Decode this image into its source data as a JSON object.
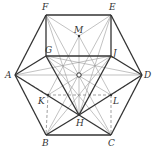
{
  "diagram": {
    "type": "geometry",
    "colors": {
      "bold": "#333333",
      "thin": "#999999",
      "dashed": "#777777",
      "point": "#333333"
    },
    "points": [
      {
        "id": "F",
        "label": "F",
        "x": 46,
        "y": 15,
        "lx": 42,
        "ly": 10
      },
      {
        "id": "E",
        "label": "E",
        "x": 111,
        "y": 15,
        "lx": 109,
        "ly": 10
      },
      {
        "id": "A",
        "label": "A",
        "x": 15,
        "y": 75,
        "lx": 5,
        "ly": 78
      },
      {
        "id": "D",
        "label": "D",
        "x": 142,
        "y": 75,
        "lx": 144,
        "ly": 78
      },
      {
        "id": "B",
        "label": "B",
        "x": 46,
        "y": 135,
        "lx": 42,
        "ly": 146
      },
      {
        "id": "C",
        "label": "C",
        "x": 111,
        "y": 135,
        "lx": 108,
        "ly": 146
      },
      {
        "id": "G",
        "label": "G",
        "x": 46,
        "y": 56,
        "lx": 45,
        "ly": 53
      },
      {
        "id": "J",
        "label": "J",
        "x": 111,
        "y": 56,
        "lx": 113,
        "ly": 56
      },
      {
        "id": "M",
        "label": "M",
        "x": 79,
        "y": 36,
        "lx": 74,
        "ly": 33
      },
      {
        "id": "K",
        "label": "K",
        "x": 48,
        "y": 95,
        "lx": 38,
        "ly": 104
      },
      {
        "id": "L",
        "label": "L",
        "x": 111,
        "y": 95,
        "lx": 113,
        "ly": 104
      },
      {
        "id": "H",
        "label": "H",
        "x": 79,
        "y": 115,
        "lx": 76,
        "ly": 126
      },
      {
        "id": "O",
        "label": "",
        "x": 79,
        "y": 75,
        "lx": 0,
        "ly": 0
      }
    ],
    "bold_segments": [
      [
        "A",
        "B"
      ],
      [
        "B",
        "C"
      ],
      [
        "C",
        "D"
      ],
      [
        "D",
        "E"
      ],
      [
        "E",
        "F"
      ],
      [
        "F",
        "A"
      ],
      [
        "F",
        "G"
      ],
      [
        "E",
        "J"
      ],
      [
        "G",
        "J"
      ],
      [
        "A",
        "G"
      ],
      [
        "A",
        "H"
      ],
      [
        "G",
        "H"
      ],
      [
        "J",
        "H"
      ],
      [
        "J",
        "D"
      ],
      [
        "H",
        "C"
      ],
      [
        "B",
        "H"
      ],
      [
        "D",
        "H"
      ]
    ],
    "thin_segments": [
      [
        "A",
        "D"
      ],
      [
        "F",
        "C"
      ],
      [
        "E",
        "B"
      ],
      [
        "M",
        "H"
      ],
      [
        "F",
        "M"
      ],
      [
        "E",
        "M"
      ],
      [
        "G",
        "L"
      ],
      [
        "J",
        "K"
      ],
      [
        "A",
        "J"
      ],
      [
        "D",
        "G"
      ],
      [
        "M",
        "K"
      ],
      [
        "M",
        "L"
      ],
      [
        "F",
        "H"
      ],
      [
        "E",
        "H"
      ],
      [
        "G",
        "C"
      ],
      [
        "J",
        "B"
      ]
    ],
    "dashed_segments": [
      [
        "K",
        "L"
      ],
      [
        "K",
        "B"
      ],
      [
        "L",
        "C"
      ],
      [
        "A",
        "K"
      ],
      [
        "D",
        "L"
      ]
    ]
  }
}
